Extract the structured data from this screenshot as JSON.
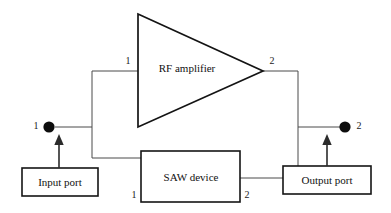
{
  "diagram": {
    "colors": {
      "background": "#ffffff",
      "wire": "#4a4a4a",
      "outline": "#141414",
      "dot": "#0d0d0d",
      "text": "#111111"
    },
    "blocks": {
      "amplifier": {
        "label": "RF amplifier",
        "shape": "triangle",
        "input_port_label": "1",
        "output_port_label": "2"
      },
      "saw": {
        "label": "SAW device",
        "shape": "rectangle",
        "input_port_label": "1",
        "output_port_label": "2"
      },
      "input_port": {
        "label": "Input port",
        "shape": "rectangle"
      },
      "output_port": {
        "label": "Output port",
        "shape": "rectangle"
      }
    },
    "terminals": {
      "input": {
        "label": "1",
        "icon": "filled-circle-node"
      },
      "output": {
        "label": "2",
        "icon": "filled-circle-node"
      }
    },
    "arrows": {
      "input_arrow_icon": "arrow-up-icon",
      "output_arrow_icon": "arrow-up-icon"
    }
  }
}
